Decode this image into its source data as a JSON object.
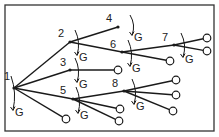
{
  "diagram": {
    "type": "game-tree",
    "frame": {
      "x": 5,
      "y": 5,
      "w": 209,
      "h": 126
    },
    "colors": {
      "line": "#1a1a1a",
      "frame": "#333333",
      "background": "#ffffff"
    },
    "decision_label": "G",
    "nodes": [
      {
        "id": "1",
        "label": "1",
        "x": 14,
        "y": 88,
        "lx": 4,
        "ly": 80,
        "gx": 18,
        "gy": 112
      },
      {
        "id": "2",
        "label": "2",
        "x": 70,
        "y": 42,
        "lx": 58,
        "ly": 37,
        "gx": 82,
        "gy": 57
      },
      {
        "id": "3",
        "label": "3",
        "x": 70,
        "y": 70,
        "lx": 60,
        "ly": 66,
        "gx": 82,
        "gy": 84
      },
      {
        "id": "4",
        "label": "4",
        "x": 118,
        "y": 27,
        "lx": 106,
        "ly": 22,
        "gx": 137,
        "gy": 37
      },
      {
        "id": "5",
        "label": "5",
        "x": 73,
        "y": 99,
        "lx": 60,
        "ly": 94,
        "gx": 83,
        "gy": 115
      },
      {
        "id": "6",
        "label": "6",
        "x": 122,
        "y": 52,
        "lx": 110,
        "ly": 48,
        "gx": 135,
        "gy": 68
      },
      {
        "id": "7",
        "label": "7",
        "x": 174,
        "y": 45,
        "lx": 162,
        "ly": 41,
        "gx": 188,
        "gy": 59
      },
      {
        "id": "8",
        "label": "8",
        "x": 124,
        "y": 91,
        "lx": 112,
        "ly": 87,
        "gx": 139,
        "gy": 106
      }
    ],
    "edges": [
      {
        "from": [
          14,
          88
        ],
        "to": [
          70,
          42
        ]
      },
      {
        "from": [
          14,
          88
        ],
        "to": [
          70,
          70
        ]
      },
      {
        "from": [
          14,
          88
        ],
        "to": [
          73,
          99
        ]
      },
      {
        "from": [
          14,
          88
        ],
        "to": [
          66,
          119
        ],
        "leaf": true
      },
      {
        "from": [
          70,
          42
        ],
        "to": [
          118,
          27
        ]
      },
      {
        "from": [
          70,
          42
        ],
        "to": [
          122,
          52
        ]
      },
      {
        "from": [
          70,
          70
        ],
        "to": [
          118,
          70
        ],
        "leaf": true
      },
      {
        "from": [
          122,
          52
        ],
        "to": [
          174,
          45
        ]
      },
      {
        "from": [
          122,
          52
        ],
        "to": [
          170,
          61
        ],
        "leaf": true
      },
      {
        "from": [
          174,
          45
        ],
        "to": [
          207,
          38
        ],
        "leaf": true
      },
      {
        "from": [
          174,
          45
        ],
        "to": [
          207,
          51
        ],
        "leaf": true
      },
      {
        "from": [
          73,
          99
        ],
        "to": [
          124,
          91
        ]
      },
      {
        "from": [
          73,
          99
        ],
        "to": [
          120,
          109
        ],
        "leaf": true
      },
      {
        "from": [
          73,
          99
        ],
        "to": [
          119,
          121
        ],
        "leaf": true
      },
      {
        "from": [
          124,
          91
        ],
        "to": [
          176,
          80
        ],
        "leaf": true
      },
      {
        "from": [
          124,
          91
        ],
        "to": [
          176,
          95
        ],
        "leaf": true
      },
      {
        "from": [
          124,
          91
        ],
        "to": [
          173,
          111
        ],
        "leaf": true
      }
    ]
  }
}
